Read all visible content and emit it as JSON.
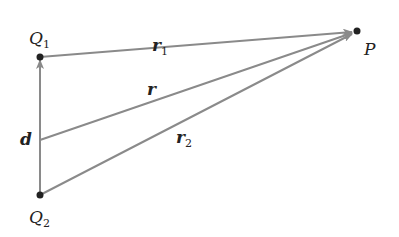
{
  "diagram": {
    "points": {
      "Q1": {
        "label": "Q",
        "sub": "1",
        "x": 40,
        "y": 57
      },
      "Q2": {
        "label": "Q",
        "sub": "2",
        "x": 40,
        "y": 195
      },
      "P": {
        "label": "P",
        "x": 356,
        "y": 31
      }
    },
    "vectors": {
      "d": {
        "label": "d",
        "from": "Q2",
        "to": "Q1"
      },
      "r": {
        "label": "r",
        "from": "midpoint",
        "to": "P"
      },
      "r1": {
        "label": "r",
        "sub": "1",
        "from": "Q1",
        "to": "P"
      },
      "r2": {
        "label": "r",
        "sub": "2",
        "from": "Q2",
        "to": "P"
      }
    },
    "colors": {
      "line": "#8a8a8a",
      "point": "#222222",
      "text": "#222222"
    }
  }
}
